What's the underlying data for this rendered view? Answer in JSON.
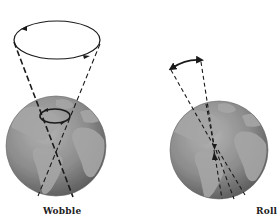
{
  "diagram": {
    "panels": [
      {
        "id": "wobble",
        "label": "Wobble"
      },
      {
        "id": "roll",
        "label": "Roll"
      }
    ],
    "colors": {
      "ocean": "#8a8a8a",
      "land": "#a9a9a9",
      "shade": "#5e5e5e",
      "line": "#1a1a1a",
      "background": "#ffffff"
    },
    "icons": {
      "wobble-globe": "earth-globe-icon",
      "roll-globe": "earth-globe-icon",
      "precession-ellipse": "circular-arrow-icon",
      "roll-arc": "double-arrow-arc-icon"
    }
  }
}
